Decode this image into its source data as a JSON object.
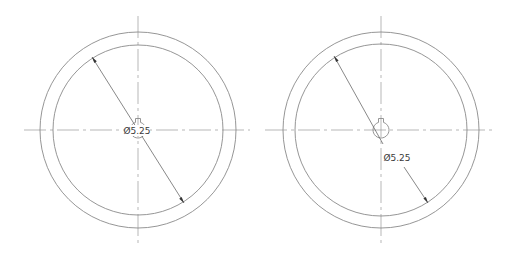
{
  "drawing": {
    "views": [
      {
        "id": "left-view",
        "center": [
          138,
          130
        ],
        "outer_radius": 98,
        "inner_radius": 85,
        "hub_radius": 8,
        "dimension": {
          "label": "Ø5.25",
          "type": "diameter",
          "label_position": "center",
          "label_xy": [
            137,
            134
          ]
        }
      },
      {
        "id": "right-view",
        "center": [
          381,
          130
        ],
        "outer_radius": 98,
        "inner_radius": 86,
        "hub_radius": 8,
        "dimension": {
          "label": "Ø5.25",
          "type": "diameter",
          "label_position": "offset-along-leader",
          "label_xy": [
            397,
            161
          ]
        }
      }
    ],
    "colors": {
      "geometry": "#8a8a8a",
      "centerline": "#9a9a9a",
      "dimension": "#555555",
      "text": "#3a3a3a"
    }
  }
}
